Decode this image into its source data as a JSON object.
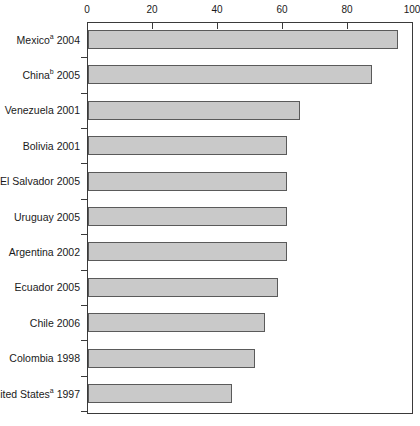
{
  "chart_data": {
    "type": "bar",
    "orientation": "horizontal",
    "title": "",
    "subtitle": "",
    "xlabel": "",
    "ylabel": "",
    "xlim": [
      0,
      100
    ],
    "xticks": [
      0,
      20,
      40,
      60,
      80,
      100
    ],
    "xtick_labels": [
      "0",
      "20",
      "40",
      "60",
      "80",
      "100"
    ],
    "grid": false,
    "legend": null,
    "bar_color": "#c9c9c9",
    "bar_border_color": "#5a5a5a",
    "axis_color": "#3a3a3a",
    "categories": [
      "Mexicoᵃ 2004",
      "Chinaᵇ 2005",
      "Venezuela 2001",
      "Bolivia 2001",
      "El Salvador 2005",
      "Uruguay 2005",
      "Argentina 2002",
      "Ecuador 2005",
      "Chile 2006",
      "Colombia 1998",
      "United Statesᵃ 1997"
    ],
    "values": [
      95,
      87,
      65,
      61,
      61,
      61,
      61,
      58,
      54,
      51,
      44
    ],
    "points": [
      {
        "name": "Mexico",
        "footnote": "a",
        "year": "2004",
        "label_main": "Mexico",
        "label_sup": "a",
        "label_tail": " 2004",
        "value": 95
      },
      {
        "name": "China",
        "footnote": "b",
        "year": "2005",
        "label_main": "China",
        "label_sup": "b",
        "label_tail": " 2005",
        "value": 87
      },
      {
        "name": "Venezuela",
        "footnote": "",
        "year": "2001",
        "label_main": "Venezuela 2001",
        "label_sup": "",
        "label_tail": "",
        "value": 65
      },
      {
        "name": "Bolivia",
        "footnote": "",
        "year": "2001",
        "label_main": "Bolivia 2001",
        "label_sup": "",
        "label_tail": "",
        "value": 61
      },
      {
        "name": "El Salvador",
        "footnote": "",
        "year": "2005",
        "label_main": "El Salvador 2005",
        "label_sup": "",
        "label_tail": "",
        "value": 61
      },
      {
        "name": "Uruguay",
        "footnote": "",
        "year": "2005",
        "label_main": "Uruguay 2005",
        "label_sup": "",
        "label_tail": "",
        "value": 61
      },
      {
        "name": "Argentina",
        "footnote": "",
        "year": "2002",
        "label_main": "Argentina 2002",
        "label_sup": "",
        "label_tail": "",
        "value": 61
      },
      {
        "name": "Ecuador",
        "footnote": "",
        "year": "2005",
        "label_main": "Ecuador 2005",
        "label_sup": "",
        "label_tail": "",
        "value": 58
      },
      {
        "name": "Chile",
        "footnote": "",
        "year": "2006",
        "label_main": "Chile 2006",
        "label_sup": "",
        "label_tail": "",
        "value": 54
      },
      {
        "name": "Colombia",
        "footnote": "",
        "year": "1998",
        "label_main": "Colombia 1998",
        "label_sup": "",
        "label_tail": "",
        "value": 51
      },
      {
        "name": "United States",
        "footnote": "a",
        "year": "1997",
        "label_main": "United States",
        "label_sup": "a",
        "label_tail": " 1997",
        "value": 44
      }
    ]
  }
}
